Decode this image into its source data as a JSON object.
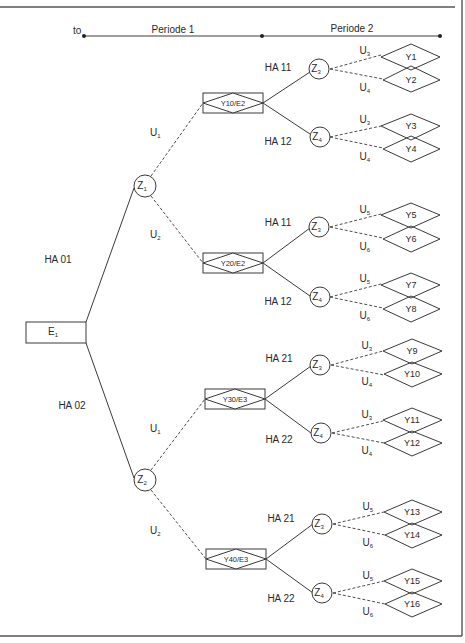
{
  "figure": {
    "timeline": {
      "start_label": "to",
      "periods": [
        {
          "label": "Periode 1"
        },
        {
          "label": "Periode 2"
        }
      ]
    },
    "root": {
      "label": "E",
      "sub": "1"
    },
    "level1_actions": [
      {
        "label": "HA 01"
      },
      {
        "label": "HA 02"
      }
    ],
    "chance_nodes_p1": [
      {
        "label": "Z",
        "sub": "1"
      },
      {
        "label": "Z",
        "sub": "2"
      }
    ],
    "states_p1": [
      {
        "label": "U",
        "sub": "1"
      },
      {
        "label": "U",
        "sub": "2"
      },
      {
        "label": "U",
        "sub": "1"
      },
      {
        "label": "U",
        "sub": "2"
      }
    ],
    "decision_boxes": [
      {
        "label": "Y10/E2"
      },
      {
        "label": "Y20/E2"
      },
      {
        "label": "Y30/E3"
      },
      {
        "label": "Y40/E3"
      }
    ],
    "level2_actions": [
      {
        "label": "HA 11"
      },
      {
        "label": "HA 12"
      },
      {
        "label": "HA 11"
      },
      {
        "label": "HA 12"
      },
      {
        "label": "HA 21"
      },
      {
        "label": "HA 22"
      },
      {
        "label": "HA 21"
      },
      {
        "label": "HA 22"
      }
    ],
    "chance_nodes_p2": [
      {
        "label": "Z",
        "sub": "3"
      },
      {
        "label": "Z",
        "sub": "4"
      },
      {
        "label": "Z",
        "sub": "3"
      },
      {
        "label": "Z",
        "sub": "4"
      },
      {
        "label": "Z",
        "sub": "3"
      },
      {
        "label": "Z",
        "sub": "4"
      },
      {
        "label": "Z",
        "sub": "3"
      },
      {
        "label": "Z",
        "sub": "4"
      }
    ],
    "states_p2": [
      {
        "label": "U",
        "sub": "3"
      },
      {
        "label": "U",
        "sub": "4"
      },
      {
        "label": "U",
        "sub": "3"
      },
      {
        "label": "U",
        "sub": "4"
      },
      {
        "label": "U",
        "sub": "5"
      },
      {
        "label": "U",
        "sub": "6"
      },
      {
        "label": "U",
        "sub": "5"
      },
      {
        "label": "U",
        "sub": "6"
      },
      {
        "label": "U",
        "sub": "3"
      },
      {
        "label": "U",
        "sub": "4"
      },
      {
        "label": "U",
        "sub": "3"
      },
      {
        "label": "U",
        "sub": "4"
      },
      {
        "label": "U",
        "sub": "5"
      },
      {
        "label": "U",
        "sub": "6"
      },
      {
        "label": "U",
        "sub": "5"
      },
      {
        "label": "U",
        "sub": "6"
      }
    ],
    "outcomes": [
      {
        "label": "Y1"
      },
      {
        "label": "Y2"
      },
      {
        "label": "Y3"
      },
      {
        "label": "Y4"
      },
      {
        "label": "Y5"
      },
      {
        "label": "Y6"
      },
      {
        "label": "Y7"
      },
      {
        "label": "Y8"
      },
      {
        "label": "Y9"
      },
      {
        "label": "Y10"
      },
      {
        "label": "Y11"
      },
      {
        "label": "Y12"
      },
      {
        "label": "Y13"
      },
      {
        "label": "Y14"
      },
      {
        "label": "Y15"
      },
      {
        "label": "Y16"
      }
    ]
  }
}
